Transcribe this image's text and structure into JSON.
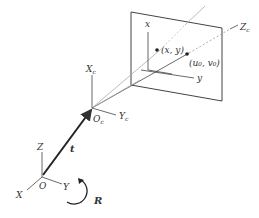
{
  "diagram": {
    "type": "camera-pinhole-model",
    "colors": {
      "line": "#444444",
      "light_line": "#aaaaaa",
      "text": "#333333"
    },
    "image_plane": {
      "axis_x_label": "x",
      "axis_y_label": "y",
      "point_label": "(x, y)",
      "principal_point_label": "(u₀, v₀)"
    },
    "camera_frame": {
      "origin_label": "O",
      "origin_sub": "c",
      "x_axis_label": "X",
      "x_axis_sub": "c",
      "y_axis_label": "Y",
      "y_axis_sub": "c",
      "z_axis_label": "Z",
      "z_axis_sub": "c"
    },
    "world_frame": {
      "origin_label": "O",
      "x_axis_label": "X",
      "y_axis_label": "Y",
      "z_axis_label": "Z"
    },
    "translation_label": "t",
    "rotation_label": "R"
  }
}
